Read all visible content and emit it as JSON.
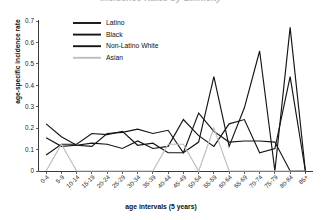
{
  "chart_data": {
    "type": "line",
    "title": "Incidence Rates by Ethnicity",
    "xlabel": "age intervals (5 years)",
    "ylabel": "age-specific incidence rate",
    "ylim": [
      0,
      0.7
    ],
    "ytick_labels": [
      "0",
      "0.1",
      "0.2",
      "0.3",
      "0.4",
      "0.5",
      "0.6",
      "0.7"
    ],
    "ytick_values": [
      0,
      0.1,
      0.2,
      0.3,
      0.4,
      0.5,
      0.6,
      0.7
    ],
    "grid": false,
    "legend_position": "top-center",
    "categories": [
      "0-4",
      "5-9",
      "10-14",
      "15-19",
      "20-24",
      "25-29",
      "30-34",
      "35-39",
      "40-44",
      "45-49",
      "50-54",
      "55-59",
      "60-64",
      "65-69",
      "70-74",
      "75-79",
      "80-84",
      "85+"
    ],
    "series": [
      {
        "name": "Latino",
        "color": "#141414",
        "width": 1.15,
        "values": [
          0.22,
          0.16,
          0.12,
          0.115,
          0.175,
          0.18,
          0.195,
          0.175,
          0.19,
          0.085,
          0.27,
          0.185,
          0.135,
          0.14,
          0.14,
          0.135,
          0.0,
          0.0
        ]
      },
      {
        "name": "Black",
        "color": "#141414",
        "width": 1.15,
        "values": [
          0.075,
          0.125,
          0.125,
          0.175,
          0.17,
          0.185,
          0.12,
          0.13,
          0.085,
          0.085,
          0.135,
          0.44,
          0.115,
          0.295,
          0.56,
          0.0,
          0.67,
          0.0
        ]
      },
      {
        "name": "Non-Latino White",
        "color": "#141414",
        "width": 1.15,
        "values": [
          0.155,
          0.115,
          0.12,
          0.13,
          0.125,
          0.105,
          0.14,
          0.105,
          0.115,
          0.24,
          0.165,
          0.115,
          0.22,
          0.24,
          0.085,
          0.105,
          0.44,
          0.0
        ]
      },
      {
        "name": "Asian",
        "color": "#bdbdbd",
        "width": 1.15,
        "values": [
          0.0,
          0.125,
          0.0,
          0.0,
          0.0,
          0.0,
          0.0,
          0.0,
          0.125,
          0.125,
          0.0,
          0.2,
          0.0,
          0.0,
          0.0,
          0.0,
          0.0,
          0.0
        ]
      }
    ]
  },
  "legend": {
    "entries": [
      {
        "label": "Latino"
      },
      {
        "label": "Black"
      },
      {
        "label": "Non-Latino White"
      },
      {
        "label": "Asian"
      }
    ]
  }
}
